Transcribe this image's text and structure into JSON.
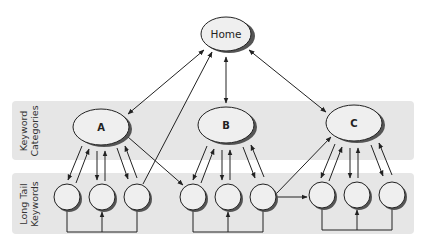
{
  "diagram": {
    "bands": [
      {
        "id": "categories",
        "label_line1": "Keyword",
        "label_line2": "Categories"
      },
      {
        "id": "longtail",
        "label_line1": "Long Tail",
        "label_line2": "Keywords"
      }
    ],
    "home": {
      "label": "Home"
    },
    "categories": [
      {
        "id": "A",
        "label": "A"
      },
      {
        "id": "B",
        "label": "B"
      },
      {
        "id": "C",
        "label": "C"
      }
    ],
    "long_tail_nodes": [
      {
        "id": "A1",
        "parent": "A"
      },
      {
        "id": "A2",
        "parent": "A"
      },
      {
        "id": "A3",
        "parent": "A"
      },
      {
        "id": "B1",
        "parent": "B"
      },
      {
        "id": "B2",
        "parent": "B"
      },
      {
        "id": "B3",
        "parent": "B"
      },
      {
        "id": "C1",
        "parent": "C"
      },
      {
        "id": "C2",
        "parent": "C"
      },
      {
        "id": "C3",
        "parent": "C"
      }
    ],
    "edges": [
      {
        "from": "Home",
        "to": "A",
        "type": "bidirectional"
      },
      {
        "from": "Home",
        "to": "B",
        "type": "bidirectional"
      },
      {
        "from": "Home",
        "to": "C",
        "type": "bidirectional"
      },
      {
        "from": "A3",
        "to": "Home",
        "type": "directed"
      },
      {
        "from": "A",
        "to": "B1",
        "type": "directed"
      },
      {
        "from": "B3",
        "to": "C",
        "type": "directed"
      },
      {
        "from": "B3",
        "to": "C1",
        "type": "directed"
      },
      {
        "from": "A",
        "to": "A1",
        "type": "bidirectional-pair"
      },
      {
        "from": "A",
        "to": "A2",
        "type": "bidirectional-pair"
      },
      {
        "from": "A",
        "to": "A3",
        "type": "bidirectional-pair"
      },
      {
        "from": "B",
        "to": "B1",
        "type": "bidirectional-pair"
      },
      {
        "from": "B",
        "to": "B2",
        "type": "bidirectional-pair"
      },
      {
        "from": "B",
        "to": "B3",
        "type": "bidirectional-pair"
      },
      {
        "from": "C",
        "to": "C1",
        "type": "bidirectional-pair"
      },
      {
        "from": "C",
        "to": "C2",
        "type": "bidirectional-pair"
      },
      {
        "from": "C",
        "to": "C3",
        "type": "bidirectional-pair"
      },
      {
        "from": "A1,A3",
        "to": "A2",
        "type": "bracket"
      },
      {
        "from": "B1,B3",
        "to": "B2",
        "type": "bracket"
      },
      {
        "from": "C1,C3",
        "to": "C2",
        "type": "bracket"
      }
    ]
  }
}
